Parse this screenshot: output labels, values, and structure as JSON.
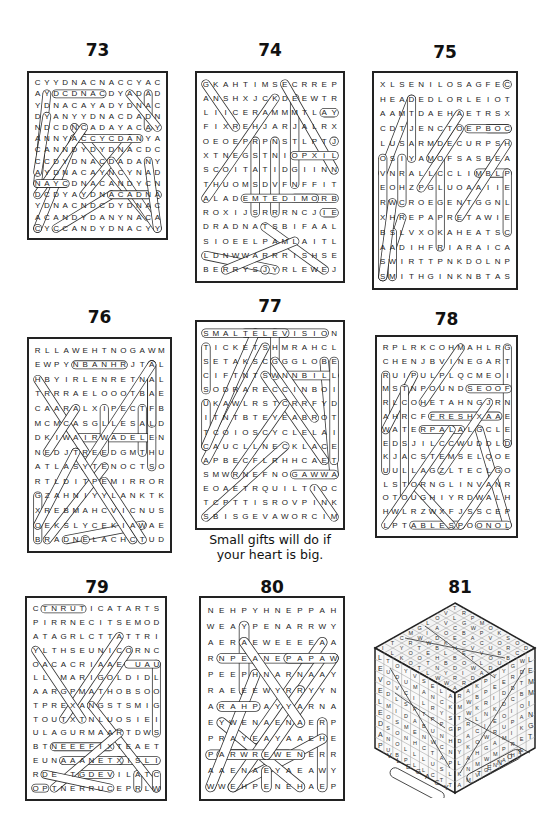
{
  "puzzles": [
    {
      "number": "73",
      "rows": [
        "CYYDNACNACCYAC",
        "AYDCDNACDYADAD",
        "YDNACAYADYDNAC",
        "DYANYYDNACDADN",
        "NDCDNCADAYACAY",
        "ANNYACCYCDANYA",
        "CANNDYDYDNACDC",
        "CCDYDNACDADANY",
        "AYDNACAYNCYNAD",
        "NAYCDNACANDYCN",
        "DCDYAYDNACADNA",
        "YDNACNDCDYDNAC",
        "ACANDYDANYNACA",
        "CYCCANDYDNACYY"
      ]
    },
    {
      "number": "74",
      "rows": [
        "GKAHTIMSECRREP",
        "ANSHXJCKDEEWTR",
        "LIICERAMMMTLAY",
        "FIXREHJARJALRX",
        "OEOEPRPNSTLPTJ",
        "XTNEGSTNIOPXIL",
        "SCOITATIDGIINN",
        "THUOMSDVFNFFIT",
        "ALADEMTEDIMORB",
        "ROXIJSRRRNCJIE",
        "DRADNATSBIFAAL",
        "SIOEELPAMLAITL",
        "LDNWWARRRISHSE",
        "BERRYSJYRLEWEJ"
      ]
    },
    {
      "number": "75",
      "rows": [
        "XLSENILOSAGFEC",
        "HEADEDLORLEIOT",
        "AAMTDAEHAETRSX",
        "CDTJENCTOEPBOC",
        "LUSARMDECURPSH",
        "OSIYAMOFSASBEA",
        "VNRALLCCLIMBLP",
        "EOHZPGLUOAAIIE",
        "RWCROEGENTGGNL",
        "XHREPAPRETAWIE",
        "BSLVXOKAHEATSC",
        "AADIHFRIARAICA",
        "SWIRTTPNKDOLNP",
        "SMITHGINKNBTAS"
      ]
    },
    {
      "number": "76",
      "rows": [
        "RLLAWEHTNOGAWM",
        "EWPYNBANHRJTAL",
        "HBYIRLENRETNAL",
        "TRRRAELOOOTBAE",
        "CAARALXIPECTFB",
        "MCMCASGLLESALD",
        "DKIWAIRWADELEN",
        "NEDJTREEDGMTHU",
        "ATLASYTENOCTSO",
        "RTLDITPEMIRROR",
        "GZAHNIYYLANKTK",
        "XREBMAHCVICNUS",
        "OEKSLYCEKIAWAE",
        "BRADNELACHCTUD"
      ]
    },
    {
      "number": "77",
      "rows": [
        "SMALTELEVISION",
        "TICKETSHMRAHCL",
        "SETAKSCGGGLOBE",
        "CIFTNTSWNNBILL",
        "SODRARECCINBOI",
        "UKAWLRSTCRRFYD",
        "ITNTBTEYEABROT",
        "TCOIOSCYCLELAI",
        "CAUCLLNECKLACE",
        "APBECFLRHHCAET",
        "SMWRNEFNOGAWWA",
        "EOAETRQUILTIOC",
        "TCPTTISROVPINK",
        "SBISGEVAWORCIM"
      ],
      "caption_line1": "Small gifts will do if",
      "caption_line2": "your heart is big."
    },
    {
      "number": "78",
      "rows": [
        "RPLRKCOHMAHLRG",
        "CHENJBVINEGART",
        "RUIPULPLQCMEOI",
        "MSTNPOUNDSEOOF",
        "RLCOHETAHNGJRN",
        "AHRCFFRESHXAAE",
        "WATERPALALGCLE",
        "EDSJILCCWUDDLD",
        "KJACSTEMSELQOE",
        "UULLAGZLTECLGO",
        "LSTORNGLINVANR",
        "OTOUGHIYRDWALH",
        "HWLRZWXFJSSCEP",
        "LPTABLESPOONOL"
      ]
    },
    {
      "number": "79",
      "rows": [
        "CTNRUTICATARTS",
        "PIRRNECITSEMOD",
        "ATAGRLCTTATTRI",
        "YLTHSEUNICORNC",
        "OACACRIAAE UAU",
        "LL MARIGOLDIDL",
        "AARGPMATHOBSOO",
        "TPREXANGSTSMIG",
        "TOUTXTNLUOSIEI",
        "ULAGURMAARTDWS",
        "BTNEEEFIXTEAET",
        "EUNAAANETXISLI",
        "RDE TGDEVILATC",
        "OPTNERRUCEPRLW"
      ]
    },
    {
      "number": "80",
      "rows": [
        "NEHPYHNEPPAH",
        "WEAYPENARRWY",
        "AERAEWEEEEAA",
        "RNPEANEPAPAW",
        "PEEPHNARNAAY",
        "RAEEEWYRRYYN",
        "ARAHPAYYARNA",
        "EYWENAENAERP",
        "PRAYEAYAAEHE",
        "PARWREWENERR",
        "AAENAEYAEAWY",
        "WWEHPENEHAEP"
      ]
    },
    {
      "number": "81",
      "type": "cube",
      "left_face_column": [
        "L",
        "E",
        "V",
        "E",
        "L",
        "E",
        "D",
        "A",
        "P"
      ],
      "bottom_left_text": [
        "V",
        "L",
        "E",
        "G",
        "A",
        "C",
        "Y"
      ],
      "right_face_column": [
        "L",
        "E",
        "M",
        "M",
        "I",
        "N",
        "G",
        "T"
      ],
      "bottom_right_text": [
        "T",
        "E",
        "N",
        "O",
        "T"
      ]
    }
  ]
}
